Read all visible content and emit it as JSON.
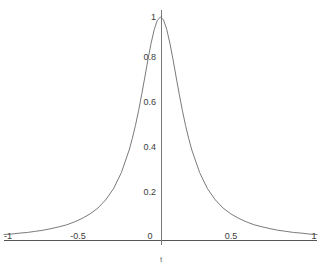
{
  "chart_data": {
    "type": "line",
    "title": "",
    "subtitle": "",
    "xlabel": "t",
    "ylabel": "",
    "xlim": [
      -1,
      1
    ],
    "ylim": [
      0,
      1
    ],
    "grid": false,
    "legend": null,
    "legend_position": "none",
    "xticks": [
      "-1",
      "-0.5",
      "0",
      "0.5",
      "1"
    ],
    "xtick_values": [
      -1,
      -0.5,
      0,
      0.5,
      1
    ],
    "yticks": [
      "0",
      "0.2",
      "0.4",
      "0.6",
      "0.8",
      "1"
    ],
    "ytick_values": [
      0,
      0.2,
      0.4,
      0.6,
      0.8,
      1
    ],
    "line_color": "#6b6b6b",
    "axis_color": "#555555",
    "series": [
      {
        "name": "peak",
        "x": [
          -1,
          -0.95,
          -0.9,
          -0.85,
          -0.8,
          -0.75,
          -0.7,
          -0.65,
          -0.6,
          -0.55,
          -0.5,
          -0.45,
          -0.4,
          -0.35,
          -0.3,
          -0.25,
          -0.2,
          -0.18,
          -0.16,
          -0.14,
          -0.12,
          -0.1,
          -0.08,
          -0.06,
          -0.04,
          -0.02,
          0,
          0.02,
          0.04,
          0.06,
          0.08,
          0.1,
          0.12,
          0.14,
          0.16,
          0.18,
          0.2,
          0.25,
          0.3,
          0.35,
          0.4,
          0.45,
          0.5,
          0.55,
          0.6,
          0.65,
          0.7,
          0.75,
          0.8,
          0.85,
          0.9,
          0.95,
          1
        ],
        "y": [
          0.027,
          0.029,
          0.033,
          0.036,
          0.041,
          0.046,
          0.053,
          0.061,
          0.07,
          0.083,
          0.099,
          0.119,
          0.145,
          0.182,
          0.232,
          0.304,
          0.405,
          0.457,
          0.515,
          0.581,
          0.654,
          0.731,
          0.81,
          0.883,
          0.944,
          0.986,
          1,
          0.986,
          0.944,
          0.883,
          0.81,
          0.731,
          0.654,
          0.581,
          0.515,
          0.457,
          0.405,
          0.304,
          0.232,
          0.182,
          0.145,
          0.119,
          0.099,
          0.083,
          0.07,
          0.061,
          0.053,
          0.046,
          0.041,
          0.036,
          0.033,
          0.029,
          0.027
        ]
      }
    ]
  },
  "axis": {
    "x_label": "t",
    "x_ticks": [
      {
        "label": "-1"
      },
      {
        "label": "-0.5"
      },
      {
        "label": "0"
      },
      {
        "label": "0.5"
      },
      {
        "label": "1"
      }
    ],
    "y_ticks": [
      {
        "label": "0.2"
      },
      {
        "label": "0.4"
      },
      {
        "label": "0.6"
      },
      {
        "label": "0.8"
      },
      {
        "label": "1"
      }
    ]
  }
}
